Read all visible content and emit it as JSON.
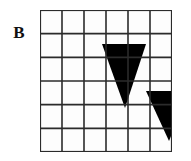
{
  "figure": {
    "panel_label": "B",
    "type": "grid-with-shapes",
    "background_color": "#ffffff",
    "grid": {
      "columns": 6,
      "rows": 6,
      "origin_x": 40,
      "origin_y": 10,
      "cell_width": 22,
      "cell_height": 23.67,
      "line_color": "#2b2b2b",
      "inner_line_width": 1.6,
      "outer_line_width": 2.2,
      "cell_fill": "#fdfdfd"
    },
    "shapes": [
      {
        "name": "triangle-upper-left",
        "kind": "triangle",
        "orientation": "pointing-down",
        "fill_color": "#000000",
        "points": "62,34 106,34 85,98",
        "spans_columns": [
          2,
          3
        ],
        "spans_rows": [
          2,
          3,
          4
        ],
        "base_width": 44,
        "height": 64
      },
      {
        "name": "triangle-lower-right",
        "kind": "triangle",
        "orientation": "pointing-down",
        "fill_color": "#000000",
        "points": "106,81 150,81 129,131",
        "spans_columns": [
          4,
          5
        ],
        "spans_rows": [
          4,
          5
        ],
        "base_width": 44,
        "height": 50
      }
    ],
    "grid_vertical_lines": [
      0,
      22,
      44,
      66,
      88,
      110,
      132
    ],
    "grid_horizontal_lines": [
      0,
      23.67,
      47.33,
      71,
      94.67,
      118.33,
      142
    ]
  }
}
